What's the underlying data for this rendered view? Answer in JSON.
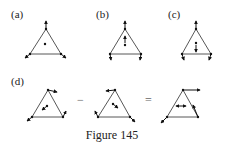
{
  "figure": {
    "caption": "Figure 145",
    "panels": [
      {
        "label": "(a)",
        "description": "triangle with three vertex vectors pointing outward from centroid, centroid dot"
      },
      {
        "label": "(b)",
        "description": "triangle with upward apex vector, centroid upward arrow, base vertices short downward arrows"
      },
      {
        "label": "(c)",
        "description": "triangle with upward apex vector, centroid downward arrow, base vertices short downward arrows"
      },
      {
        "label": "(d)",
        "description": "vector subtraction of two triangle displacement fields equals rotation-like field"
      }
    ],
    "operators": {
      "minus": "−",
      "equals": "="
    }
  }
}
